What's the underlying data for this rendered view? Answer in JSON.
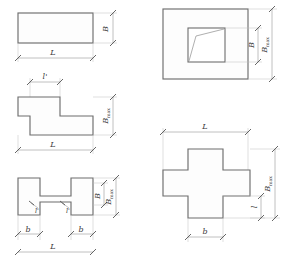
{
  "figure": {
    "type": "technical-drawing",
    "background_color": "#ffffff",
    "outline_color": "#6d6d6d",
    "dimension_color": "#8d8d8d",
    "label_color": "#3a3a3a"
  },
  "shapes": [
    {
      "id": "rectangle",
      "name": "rectangular-profile",
      "position": "top-left",
      "labels": {
        "height": "B",
        "length": "L"
      }
    },
    {
      "id": "step",
      "name": "step-profile",
      "position": "middle-left",
      "labels": {
        "step_width": "l'",
        "height": "B",
        "height_sub": "max",
        "length": "L"
      }
    },
    {
      "id": "ibeam",
      "name": "i-beam-profile",
      "position": "bottom-left",
      "labels": {
        "web_left": "l'",
        "web_right": "l'",
        "web_height": "B",
        "total_height": "B",
        "total_height_sub": "max",
        "flange_left": "b",
        "flange_right": "b",
        "length": "L"
      }
    },
    {
      "id": "square-frame",
      "name": "square-frame-profile",
      "position": "top-right",
      "labels": {
        "inner_height": "B",
        "outer_height": "B",
        "outer_height_sub": "max"
      }
    },
    {
      "id": "cross",
      "name": "cross-profile",
      "position": "bottom-right",
      "labels": {
        "length": "L",
        "height": "B",
        "height_sub": "max",
        "arm_length": "l",
        "width": "b"
      }
    }
  ]
}
